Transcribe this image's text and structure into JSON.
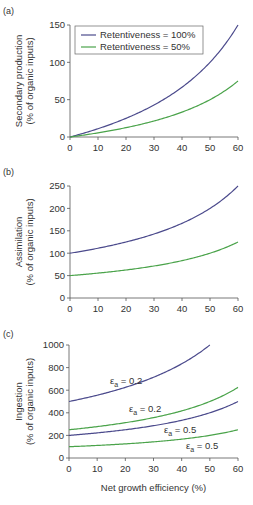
{
  "colors": {
    "series_100": "#4b4a8c",
    "series_50": "#4aa34a",
    "axis": "#555555"
  },
  "chart_data": [
    {
      "panel": "(a)",
      "type": "line",
      "xlabel": "",
      "ylabel": "Secondary production (% of organic inputs)",
      "ylabel_line1": "Secondary production",
      "ylabel_line2": "(% of organic inputs)",
      "xlim": [
        0,
        60
      ],
      "ylim": [
        0,
        150
      ],
      "xticks": [
        0,
        10,
        20,
        30,
        40,
        50,
        60
      ],
      "yticks": [
        0,
        50,
        100,
        150
      ],
      "legend": [
        "Retentiveness = 100%",
        "Retentiveness = 50%"
      ],
      "x": [
        0,
        10,
        20,
        30,
        40,
        50,
        60
      ],
      "series": [
        {
          "name": "Retentiveness = 100%",
          "values": [
            0,
            11.1,
            25,
            42.9,
            66.7,
            100,
            150
          ]
        },
        {
          "name": "Retentiveness = 50%",
          "values": [
            0,
            5.6,
            12.5,
            21.4,
            33.3,
            50,
            75
          ]
        }
      ]
    },
    {
      "panel": "(b)",
      "type": "line",
      "xlabel": "",
      "ylabel": "Assimilation (% of organic inputs)",
      "ylabel_line1": "Assimilation",
      "ylabel_line2": "(% of organic inputs)",
      "xlim": [
        0,
        60
      ],
      "ylim": [
        0,
        250
      ],
      "xticks": [
        0,
        10,
        20,
        30,
        40,
        50,
        60
      ],
      "yticks": [
        0,
        50,
        100,
        150,
        200,
        250
      ],
      "x": [
        0,
        10,
        20,
        30,
        40,
        50,
        60
      ],
      "series": [
        {
          "name": "Retentiveness = 100%",
          "values": [
            100,
            111.1,
            125,
            142.9,
            166.7,
            200,
            250
          ]
        },
        {
          "name": "Retentiveness = 50%",
          "values": [
            50,
            55.6,
            62.5,
            71.4,
            83.3,
            100,
            125
          ]
        }
      ]
    },
    {
      "panel": "(c)",
      "type": "line",
      "xlabel": "Net growth efficiency (%)",
      "ylabel": "Ingestion (% of organic inputs)",
      "ylabel_line1": "Ingestion",
      "ylabel_line2": "(% of organic inputs)",
      "xlim": [
        0,
        60
      ],
      "ylim": [
        0,
        1000
      ],
      "xticks": [
        0,
        10,
        20,
        30,
        40,
        50,
        60
      ],
      "yticks": [
        0,
        200,
        400,
        600,
        800,
        1000
      ],
      "x": [
        0,
        10,
        20,
        30,
        40,
        50,
        60
      ],
      "annotations": [
        "εa = 0.2",
        "εa = 0.2",
        "εa = 0.5",
        "εa = 0.5"
      ],
      "series": [
        {
          "name": "Retentiveness = 100%, εa = 0.2",
          "values": [
            500,
            555.6,
            625,
            714.3,
            833.3,
            1000,
            null
          ]
        },
        {
          "name": "Retentiveness = 50%, εa = 0.2",
          "values": [
            250,
            277.8,
            312.5,
            357.1,
            416.7,
            500,
            625
          ]
        },
        {
          "name": "Retentiveness = 100%, εa = 0.5",
          "values": [
            200,
            222.2,
            250,
            285.7,
            333.3,
            400,
            500
          ]
        },
        {
          "name": "Retentiveness = 50%, εa = 0.5",
          "values": [
            100,
            111.1,
            125,
            142.9,
            166.7,
            200,
            250
          ]
        }
      ]
    }
  ]
}
